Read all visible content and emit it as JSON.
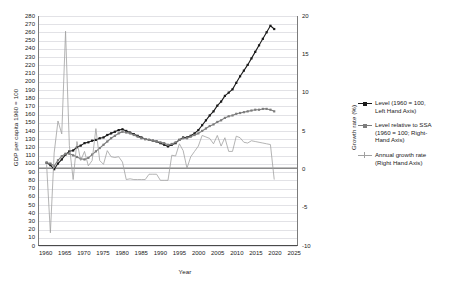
{
  "chart_data": {
    "type": "line",
    "title": "",
    "xlabel": "Year",
    "ylabel_left": "GDP per capita 1960 = 100",
    "ylabel_right": "Growth rate (%)",
    "xlim": [
      1958,
      2026
    ],
    "ylim_left": [
      0,
      280
    ],
    "ylim_right": [
      -10,
      20
    ],
    "ytick_left": [
      0,
      10,
      20,
      30,
      40,
      50,
      60,
      70,
      80,
      90,
      100,
      110,
      120,
      130,
      140,
      150,
      160,
      170,
      180,
      190,
      200,
      210,
      220,
      230,
      240,
      250,
      260,
      270,
      280
    ],
    "ytick_right": [
      -10,
      -5,
      0,
      5,
      10,
      15,
      20
    ],
    "xticks": [
      1960,
      1965,
      1970,
      1975,
      1980,
      1985,
      1990,
      1995,
      2000,
      2005,
      2010,
      2015,
      2020,
      2025
    ],
    "grid": "horizontal",
    "legend_position": "right-outside",
    "series": [
      {
        "name": "Level (1960 = 100, Left Hand Axis)",
        "axis": "left",
        "color": "#1a1a1a",
        "marker": "square",
        "x": [
          1960,
          1961,
          1962,
          1963,
          1964,
          1965,
          1966,
          1967,
          1968,
          1969,
          1970,
          1971,
          1972,
          1973,
          1974,
          1975,
          1976,
          1977,
          1978,
          1979,
          1980,
          1981,
          1982,
          1983,
          1984,
          1985,
          1986,
          1987,
          1988,
          1989,
          1990,
          1991,
          1992,
          1993,
          1994,
          1995,
          1996,
          1997,
          1998,
          1999,
          2000,
          2001,
          2002,
          2003,
          2004,
          2005,
          2006,
          2007,
          2008,
          2009,
          2010,
          2011,
          2012,
          2013,
          2014,
          2015,
          2016,
          2017,
          2018,
          2019,
          2020
        ],
        "values": [
          100,
          97,
          92,
          99,
          104,
          110,
          114,
          115,
          119,
          121,
          124,
          125,
          127,
          128,
          130,
          131,
          134,
          136,
          138,
          140,
          141,
          139,
          137,
          135,
          133,
          131,
          129,
          128,
          127,
          126,
          124,
          122,
          120,
          122,
          124,
          128,
          131,
          131,
          133,
          136,
          140,
          146,
          152,
          158,
          163,
          170,
          175,
          182,
          186,
          190,
          198,
          206,
          213,
          220,
          228,
          236,
          244,
          252,
          260,
          268,
          264
        ]
      },
      {
        "name": "Level relative to SSA (1960 = 100; Right-Hand Axis)",
        "axis": "left",
        "color": "#7d7d7d",
        "marker": "square",
        "x": [
          1960,
          1961,
          1962,
          1963,
          1964,
          1965,
          1966,
          1967,
          1968,
          1969,
          1970,
          1971,
          1972,
          1973,
          1974,
          1975,
          1976,
          1977,
          1978,
          1979,
          1980,
          1981,
          1982,
          1983,
          1984,
          1985,
          1986,
          1987,
          1988,
          1989,
          1990,
          1991,
          1992,
          1993,
          1994,
          1995,
          1996,
          1997,
          1998,
          1999,
          2000,
          2001,
          2002,
          2003,
          2004,
          2005,
          2006,
          2007,
          2008,
          2009,
          2010,
          2011,
          2012,
          2013,
          2014,
          2015,
          2016,
          2017,
          2018,
          2019,
          2020
        ],
        "values": [
          100,
          99,
          96,
          103,
          108,
          111,
          111,
          109,
          107,
          105,
          104,
          106,
          110,
          114,
          118,
          122,
          126,
          130,
          133,
          136,
          138,
          137,
          136,
          134,
          132,
          130,
          129,
          128,
          127,
          126,
          125,
          124,
          122,
          123,
          125,
          128,
          130,
          130,
          132,
          134,
          136,
          139,
          142,
          145,
          147,
          150,
          152,
          155,
          157,
          158,
          160,
          161,
          162,
          163,
          164,
          165,
          165,
          166,
          166,
          165,
          163
        ]
      },
      {
        "name": "Annual growth rate (Right Hand Axis)",
        "axis": "right",
        "color": "#a0a0a0",
        "marker": "none",
        "x": [
          1960,
          1961,
          1962,
          1963,
          1964,
          1965,
          1966,
          1967,
          1968,
          1969,
          1970,
          1971,
          1972,
          1973,
          1974,
          1975,
          1976,
          1977,
          1978,
          1979,
          1980,
          1981,
          1982,
          1983,
          1984,
          1985,
          1986,
          1987,
          1988,
          1989,
          1990,
          1991,
          1992,
          1993,
          1994,
          1995,
          1996,
          1997,
          1998,
          1999,
          2000,
          2001,
          2002,
          2003,
          2004,
          2005,
          2006,
          2007,
          2008,
          2009,
          2010,
          2011,
          2012,
          2013,
          2014,
          2015,
          2016,
          2017,
          2018,
          2019,
          2020
        ],
        "values": [
          0.5,
          -8.5,
          2.0,
          6.2,
          4.5,
          18.0,
          3.0,
          -1.5,
          3.5,
          1.0,
          2.2,
          0.3,
          1.0,
          5.2,
          1.0,
          0.5,
          2.3,
          1.5,
          1.4,
          1.5,
          0.8,
          -1.5,
          -1.4,
          -1.5,
          -1.5,
          -1.5,
          -1.5,
          -0.8,
          -0.8,
          -0.8,
          -1.6,
          -1.6,
          -1.6,
          1.7,
          1.6,
          3.2,
          2.3,
          0.0,
          1.5,
          2.2,
          2.9,
          4.3,
          4.1,
          3.9,
          3.2,
          4.3,
          2.9,
          4.0,
          2.2,
          2.2,
          4.2,
          4.0,
          3.4,
          3.3,
          3.6,
          3.5,
          3.4,
          3.3,
          3.2,
          3.1,
          -1.5
        ]
      }
    ],
    "legend_entries": [
      {
        "label_lines": [
          "Level (1960 = 100,",
          "Left Hand Axis)"
        ],
        "color": "#1a1a1a",
        "marker": "square"
      },
      {
        "label_lines": [
          "Level relative to SSA",
          "(1960 = 100; Right-",
          "Hand Axis)"
        ],
        "color": "#7d7d7d",
        "marker": "square"
      },
      {
        "label_lines": [
          "Annual growth rate",
          "(Right Hand Axis)"
        ],
        "color": "#a0a0a0",
        "marker": "plus"
      }
    ]
  }
}
